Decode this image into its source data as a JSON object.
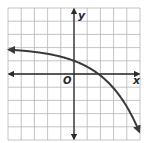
{
  "graph": {
    "type": "function-graph",
    "x_axis_label": "x",
    "y_axis_label": "y",
    "origin_label": "O",
    "grid": {
      "x_min": -5,
      "x_max": 5,
      "y_min": -5,
      "y_max": 5,
      "step": 1
    },
    "curve": {
      "description": "Decreasing exponential curve approaching horizontal asymptote y = 2 on the left, y-intercept 1, x-intercept about 2, falling steeply to the right",
      "approx_function": "y = 2 - 2^(x/1.85)",
      "y_intercept": 1,
      "x_intercept": 2,
      "asymptote": 2,
      "points": [
        [
          -5,
          1.85
        ],
        [
          -4,
          1.78
        ],
        [
          -2,
          1.53
        ],
        [
          0,
          1
        ],
        [
          1,
          0.55
        ],
        [
          2,
          0
        ],
        [
          3,
          -1.07
        ],
        [
          4,
          -2.48
        ],
        [
          5,
          -4.5
        ]
      ],
      "arrows": [
        "left",
        "right"
      ]
    },
    "colors": {
      "grid": "#b5b5b5",
      "axes": "#2a2a2a",
      "curve": "#3a3a3a",
      "background": "#ffffff"
    }
  },
  "chart_data": {
    "type": "line",
    "title": "",
    "xlabel": "x",
    "ylabel": "y",
    "xlim": [
      -5,
      5
    ],
    "ylim": [
      -5,
      5
    ],
    "grid": true,
    "series": [
      {
        "name": "curve",
        "x": [
          -5,
          -4,
          -2,
          0,
          1,
          2,
          3,
          4,
          5
        ],
        "y": [
          1.85,
          1.78,
          1.53,
          1,
          0.55,
          0,
          -1.07,
          -2.48,
          -4.5
        ]
      }
    ],
    "annotations": [
      "O"
    ]
  }
}
